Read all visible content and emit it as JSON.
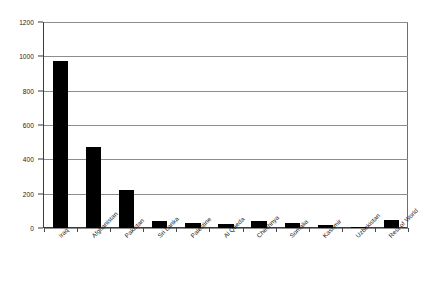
{
  "chart_data": {
    "type": "bar",
    "title": "",
    "xlabel": "",
    "ylabel": "",
    "ylim": [
      0,
      1200
    ],
    "grid": true,
    "legend": false,
    "y_ticks": [
      0,
      200,
      400,
      600,
      800,
      1000,
      1200
    ],
    "y_tick_labels": [
      "0",
      "200",
      "400",
      "600",
      "800",
      "1000",
      "1200"
    ],
    "categories": [
      "Iraq",
      "Afghanistan",
      "Pakistan",
      "Sri Lanka",
      "Palestine",
      "Al Qaeda",
      "Chechnya",
      "Somalia",
      "Kashmir",
      "Uzbekistan",
      "Rest of World"
    ],
    "values": [
      970,
      470,
      220,
      40,
      30,
      25,
      38,
      30,
      20,
      5,
      48
    ],
    "bar_color": "#000000",
    "plot_background": "#ffffff",
    "grid_color": "#8d8d8d",
    "axis_color": "#3a3a3a"
  }
}
